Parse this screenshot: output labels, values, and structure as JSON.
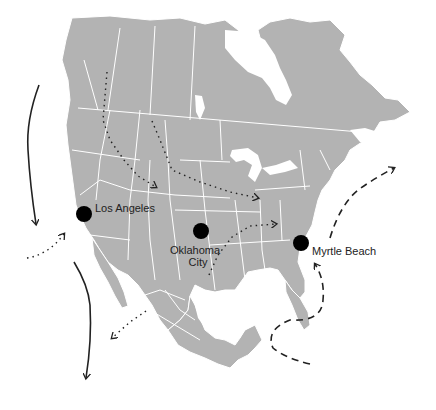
{
  "map": {
    "region": "North America",
    "land_color": "#b3b3b3",
    "border_color": "#ffffff",
    "background": "#ffffff"
  },
  "cities": [
    {
      "name": "Los Angeles",
      "x": 84,
      "y": 214
    },
    {
      "name": "Oklahoma City",
      "line1": "Oklahoma",
      "line2": "City",
      "x": 201,
      "y": 231
    },
    {
      "name": "Myrtle Beach",
      "x": 301,
      "y": 243
    }
  ],
  "routes": [
    {
      "style": "solid",
      "description": "Pacific coast southward, north segment"
    },
    {
      "style": "solid",
      "description": "Pacific coast southward, south segment"
    },
    {
      "style": "dotted",
      "description": "Pacific inflow toward Los Angeles"
    },
    {
      "style": "dotted",
      "description": "Rockies to central plains"
    },
    {
      "style": "dotted",
      "description": "Northern plains to Midwest"
    },
    {
      "style": "dotted",
      "description": "Gulf/Texas to Tennessee"
    },
    {
      "style": "dotted",
      "description": "Mexico toward Pacific"
    },
    {
      "style": "dashed",
      "description": "Atlantic loop toward Myrtle Beach"
    },
    {
      "style": "dashed",
      "description": "Atlantic coast northeastward"
    }
  ]
}
